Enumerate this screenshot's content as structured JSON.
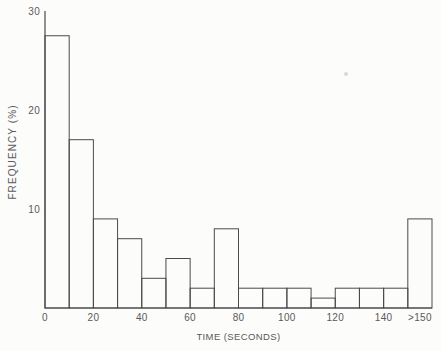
{
  "figure": {
    "background": "#fcfcfa"
  },
  "chart_data": {
    "type": "bar",
    "chart_kind": "histogram",
    "title": "",
    "xlabel": "TIME (SECONDS)",
    "ylabel": "FREQUENCY (%)",
    "bin_width_seconds": 10,
    "categories": [
      "0-10",
      "10-20",
      "20-30",
      "30-40",
      "40-50",
      "50-60",
      "60-70",
      "70-80",
      "80-90",
      "90-100",
      "100-110",
      "110-120",
      "120-130",
      "130-140",
      "140-150",
      ">150"
    ],
    "values": [
      27.5,
      17,
      9,
      7,
      3,
      5,
      2,
      8,
      2,
      2,
      2,
      1,
      2,
      2,
      2,
      9
    ],
    "ylim": [
      0,
      30
    ],
    "y_ticks": [
      10,
      20,
      30
    ],
    "x_tick_labels": [
      "0",
      "20",
      "40",
      "60",
      "80",
      "100",
      "120",
      "140",
      ">150"
    ],
    "x_tick_seconds": [
      0,
      20,
      40,
      60,
      80,
      100,
      120,
      140,
      155
    ],
    "grid": false,
    "legend": "none",
    "bar_fill": "none",
    "line_color": "#4a4a4a",
    "text_color": "#5a5a5a"
  }
}
